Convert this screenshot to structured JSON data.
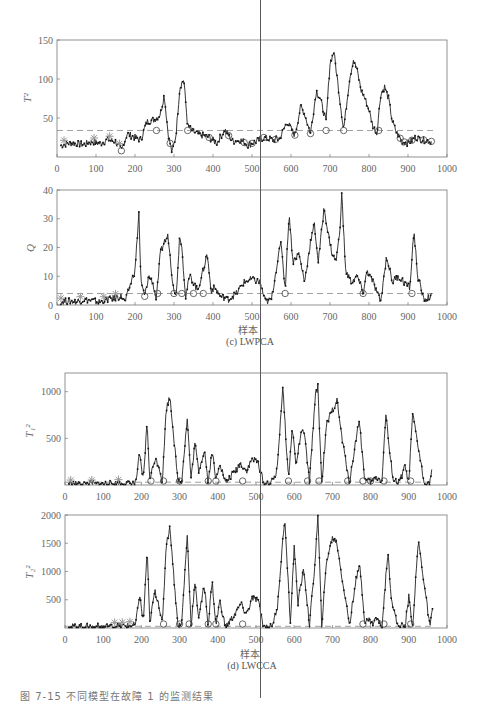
{
  "figure": {
    "figure_caption": "图 7-15  不同模型在故障 1 的监测结果",
    "subfigures": [
      {
        "id": "c",
        "caption": "(c) LWPCA",
        "xlabel": "样本"
      },
      {
        "id": "d",
        "caption": "(d) LWCCA",
        "xlabel": "样本"
      }
    ]
  },
  "chart_data": [
    {
      "type": "line",
      "title": "",
      "subfigure": "(c) LWPCA",
      "ylabel": "T²",
      "xlabel": "",
      "xlim": [
        0,
        1000
      ],
      "ylim": [
        0,
        150
      ],
      "xticks": [
        0,
        100,
        200,
        300,
        400,
        500,
        600,
        700,
        800,
        900,
        1000
      ],
      "yticks": [
        50,
        100,
        150
      ],
      "threshold": 34,
      "x": [
        10,
        30,
        50,
        70,
        90,
        110,
        130,
        150,
        165,
        180,
        200,
        215,
        230,
        250,
        265,
        275,
        285,
        295,
        305,
        315,
        325,
        335,
        350,
        370,
        390,
        410,
        430,
        450,
        470,
        490,
        510,
        530,
        550,
        570,
        590,
        610,
        625,
        635,
        650,
        665,
        675,
        690,
        700,
        710,
        720,
        735,
        750,
        760,
        770,
        780,
        790,
        800,
        810,
        820,
        830,
        840,
        850,
        860,
        870,
        885,
        900,
        920,
        940,
        960
      ],
      "values": [
        15,
        18,
        17,
        16,
        20,
        17,
        22,
        20,
        8,
        30,
        25,
        22,
        45,
        48,
        55,
        80,
        30,
        5,
        28,
        90,
        100,
        40,
        32,
        28,
        25,
        18,
        35,
        20,
        22,
        15,
        20,
        25,
        22,
        23,
        45,
        28,
        65,
        55,
        30,
        85,
        75,
        45,
        120,
        135,
        95,
        35,
        100,
        125,
        110,
        85,
        75,
        60,
        40,
        30,
        80,
        90,
        75,
        45,
        32,
        20,
        18,
        25,
        22,
        20
      ],
      "anomaly_markers_x": [
        18,
        95,
        135,
        160
      ],
      "circle_markers_x": [
        165,
        255,
        290,
        335,
        390,
        440,
        480,
        500,
        530,
        560,
        610,
        650,
        690,
        735,
        825,
        880,
        890,
        910,
        940,
        960
      ],
      "grid": false
    },
    {
      "type": "line",
      "title": "",
      "subfigure": "(c) LWPCA",
      "ylabel": "Q",
      "xlabel": "样本",
      "xlim": [
        0,
        1000
      ],
      "ylim": [
        0,
        40
      ],
      "xticks": [
        0,
        100,
        200,
        300,
        400,
        500,
        600,
        700,
        800,
        900,
        1000
      ],
      "yticks": [
        0,
        10,
        20,
        30,
        40
      ],
      "threshold": 4,
      "x": [
        10,
        30,
        50,
        70,
        90,
        110,
        130,
        150,
        165,
        175,
        190,
        200,
        210,
        215,
        225,
        235,
        245,
        255,
        265,
        275,
        285,
        295,
        305,
        315,
        320,
        330,
        340,
        350,
        360,
        375,
        385,
        395,
        405,
        420,
        440,
        460,
        480,
        500,
        520,
        535,
        550,
        565,
        575,
        585,
        595,
        605,
        620,
        635,
        650,
        660,
        670,
        685,
        695,
        705,
        715,
        725,
        730,
        740,
        755,
        770,
        785,
        795,
        810,
        830,
        845,
        860,
        875,
        890,
        905,
        915,
        925,
        940,
        960
      ],
      "values": [
        1,
        1.5,
        1,
        2,
        1.5,
        1,
        2,
        2.5,
        3,
        1,
        8,
        12,
        32,
        8,
        3,
        10,
        8,
        2,
        18,
        22,
        24,
        10,
        2,
        25,
        20,
        3,
        10,
        8,
        5,
        12,
        18,
        5,
        6,
        3,
        2,
        4,
        8,
        9,
        8,
        1,
        2,
        15,
        22,
        5,
        32,
        15,
        18,
        8,
        22,
        28,
        15,
        34,
        25,
        18,
        15,
        25,
        39,
        12,
        8,
        10,
        4,
        12,
        8,
        1,
        17,
        8,
        10,
        8,
        6,
        26,
        10,
        2,
        3
      ],
      "anomaly_markers_x": [
        10,
        60,
        120,
        150
      ],
      "circle_markers_x": [
        225,
        258,
        300,
        320,
        350,
        375,
        585,
        785,
        910
      ],
      "grid": false
    },
    {
      "type": "line",
      "title": "",
      "subfigure": "(d) LWCCA",
      "ylabel": "T₁²",
      "xlabel": "",
      "xlim": [
        0,
        1000
      ],
      "ylim": [
        0,
        1200
      ],
      "xticks": [
        0,
        100,
        200,
        300,
        400,
        500,
        600,
        700,
        800,
        900,
        1000
      ],
      "yticks": [
        500,
        1000
      ],
      "threshold": 30,
      "x": [
        10,
        50,
        100,
        150,
        185,
        195,
        205,
        215,
        222,
        235,
        245,
        255,
        265,
        275,
        285,
        295,
        305,
        320,
        330,
        340,
        350,
        365,
        375,
        385,
        395,
        405,
        420,
        440,
        460,
        475,
        490,
        505,
        520,
        540,
        555,
        570,
        585,
        595,
        605,
        615,
        625,
        640,
        655,
        662,
        672,
        685,
        700,
        712,
        725,
        745,
        760,
        770,
        785,
        800,
        815,
        830,
        840,
        850,
        860,
        875,
        890,
        900,
        910,
        925,
        940,
        955,
        960
      ],
      "values": [
        10,
        10,
        12,
        15,
        20,
        320,
        50,
        680,
        50,
        280,
        220,
        40,
        820,
        950,
        500,
        60,
        30,
        710,
        60,
        450,
        150,
        380,
        20,
        380,
        40,
        250,
        20,
        120,
        230,
        150,
        280,
        250,
        20,
        20,
        150,
        1050,
        60,
        620,
        200,
        500,
        600,
        30,
        950,
        1050,
        20,
        650,
        800,
        910,
        500,
        20,
        450,
        700,
        50,
        30,
        80,
        50,
        770,
        330,
        50,
        20,
        200,
        20,
        760,
        400,
        20,
        20,
        170
      ],
      "anomaly_markers_x": [
        15,
        70,
        140
      ],
      "circle_markers_x": [
        225,
        258,
        300,
        375,
        395,
        465,
        585,
        635,
        665,
        740,
        780,
        800,
        835,
        905
      ],
      "grid": false
    },
    {
      "type": "line",
      "title": "",
      "subfigure": "(d) LWCCA",
      "ylabel": "T₂²",
      "xlabel": "样本",
      "xlim": [
        0,
        1000
      ],
      "ylim": [
        0,
        2000
      ],
      "xticks": [
        0,
        100,
        200,
        300,
        400,
        500,
        600,
        700,
        800,
        900,
        1000
      ],
      "yticks": [
        500,
        1000,
        1500,
        2000
      ],
      "threshold": 30,
      "x": [
        10,
        50,
        100,
        150,
        185,
        195,
        205,
        215,
        222,
        235,
        245,
        255,
        265,
        275,
        285,
        295,
        305,
        320,
        330,
        340,
        350,
        365,
        375,
        385,
        395,
        405,
        420,
        440,
        460,
        475,
        490,
        505,
        520,
        540,
        555,
        575,
        590,
        600,
        610,
        625,
        640,
        655,
        662,
        672,
        685,
        700,
        712,
        725,
        745,
        760,
        772,
        785,
        795,
        805,
        815,
        830,
        845,
        855,
        870,
        890,
        900,
        910,
        925,
        940,
        955,
        962
      ],
      "values": [
        20,
        20,
        25,
        30,
        50,
        600,
        100,
        1380,
        80,
        650,
        450,
        50,
        1500,
        1780,
        900,
        80,
        30,
        1650,
        60,
        780,
        200,
        750,
        40,
        850,
        40,
        480,
        20,
        200,
        420,
        250,
        520,
        500,
        20,
        20,
        300,
        1950,
        80,
        1450,
        450,
        1050,
        50,
        1200,
        1990,
        40,
        1200,
        1600,
        1500,
        900,
        50,
        800,
        1100,
        100,
        150,
        80,
        180,
        30,
        1350,
        500,
        50,
        30,
        550,
        30,
        1550,
        800,
        20,
        300
      ],
      "anomaly_markers_x": [
        130,
        150,
        170
      ],
      "circle_markers_x": [
        258,
        300,
        325,
        375,
        395,
        465,
        780,
        835,
        905
      ],
      "grid": false
    }
  ]
}
